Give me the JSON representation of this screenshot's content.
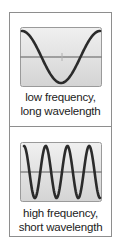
{
  "diagrams": [
    {
      "caption_line1": "low frequency,",
      "caption_line2": "long wavelength",
      "cycles": 1
    },
    {
      "caption_line1": "high frequency,",
      "caption_line2": "short wavelength",
      "cycles": 3.5
    }
  ],
  "colors": {
    "panel_fill": "#dedede",
    "panel_border": "#9a9a9a",
    "wave": "#2b2b2b",
    "axis": "#5a5a5a"
  }
}
